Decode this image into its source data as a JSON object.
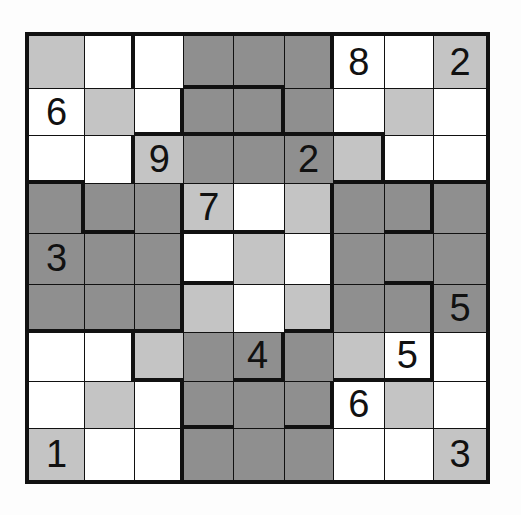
{
  "puzzle": {
    "type": "jigsaw-sudoku",
    "size": 9,
    "colors": {
      "W": "#ffffff",
      "L": "#c4c4c4",
      "D": "#8f8f8f",
      "line": "#111111"
    },
    "shading": [
      [
        "L",
        "W",
        "W",
        "D",
        "D",
        "D",
        "W",
        "W",
        "L"
      ],
      [
        "W",
        "L",
        "W",
        "D",
        "D",
        "D",
        "W",
        "L",
        "W"
      ],
      [
        "W",
        "W",
        "L",
        "D",
        "D",
        "D",
        "L",
        "W",
        "W"
      ],
      [
        "D",
        "D",
        "D",
        "L",
        "W",
        "L",
        "D",
        "D",
        "D"
      ],
      [
        "D",
        "D",
        "D",
        "W",
        "L",
        "W",
        "D",
        "D",
        "D"
      ],
      [
        "D",
        "D",
        "D",
        "L",
        "W",
        "L",
        "D",
        "D",
        "D"
      ],
      [
        "W",
        "W",
        "L",
        "D",
        "D",
        "D",
        "L",
        "W",
        "W"
      ],
      [
        "W",
        "L",
        "W",
        "D",
        "D",
        "D",
        "W",
        "L",
        "W"
      ],
      [
        "L",
        "W",
        "W",
        "D",
        "D",
        "D",
        "W",
        "W",
        "L"
      ]
    ],
    "givens": [
      [
        "",
        "",
        "",
        "",
        "",
        "",
        "8",
        "",
        "2"
      ],
      [
        "6",
        "",
        "",
        "",
        "",
        "",
        "",
        "",
        ""
      ],
      [
        "",
        "",
        "9",
        "",
        "",
        "2",
        "",
        "",
        ""
      ],
      [
        "",
        "",
        "",
        "7",
        "",
        "",
        "",
        "",
        ""
      ],
      [
        "3",
        "",
        "",
        "",
        "",
        "",
        "",
        "",
        ""
      ],
      [
        "",
        "",
        "",
        "",
        "",
        "",
        "",
        "",
        "5"
      ],
      [
        "",
        "",
        "",
        "",
        "4",
        "",
        "",
        "5",
        ""
      ],
      [
        "",
        "",
        "",
        "",
        "",
        "",
        "6",
        "",
        ""
      ],
      [
        "1",
        "",
        "",
        "",
        "",
        "",
        "",
        "",
        "3"
      ]
    ],
    "thick_right": [
      [
        0,
        1,
        0,
        0,
        0,
        1,
        0,
        0,
        0
      ],
      [
        0,
        0,
        1,
        0,
        1,
        0,
        0,
        0,
        0
      ],
      [
        0,
        1,
        0,
        0,
        0,
        0,
        1,
        0,
        0
      ],
      [
        1,
        0,
        1,
        0,
        0,
        1,
        0,
        1,
        0
      ],
      [
        0,
        0,
        1,
        0,
        0,
        1,
        0,
        0,
        0
      ],
      [
        0,
        0,
        1,
        0,
        0,
        1,
        0,
        1,
        0
      ],
      [
        0,
        1,
        0,
        0,
        1,
        0,
        0,
        1,
        0
      ],
      [
        0,
        0,
        1,
        0,
        0,
        1,
        0,
        0,
        0
      ],
      [
        0,
        0,
        1,
        0,
        0,
        0,
        0,
        0,
        0
      ]
    ],
    "thick_bottom": [
      [
        0,
        0,
        0,
        1,
        1,
        0,
        0,
        0,
        0
      ],
      [
        0,
        0,
        1,
        1,
        1,
        1,
        1,
        0,
        0
      ],
      [
        1,
        0,
        0,
        0,
        0,
        0,
        1,
        1,
        1
      ],
      [
        0,
        1,
        0,
        1,
        1,
        0,
        0,
        1,
        0
      ],
      [
        0,
        0,
        0,
        1,
        0,
        0,
        0,
        1,
        0
      ],
      [
        1,
        1,
        1,
        0,
        0,
        1,
        0,
        0,
        0
      ],
      [
        0,
        0,
        1,
        0,
        1,
        0,
        1,
        1,
        0
      ],
      [
        0,
        0,
        0,
        1,
        0,
        1,
        0,
        0,
        0
      ],
      [
        0,
        0,
        0,
        0,
        0,
        0,
        0,
        0,
        0
      ]
    ],
    "col_edges": [
      0,
      57,
      108,
      158,
      209,
      260,
      310,
      362,
      412,
      465
    ],
    "row_edges": [
      0,
      54,
      102,
      151,
      202,
      253,
      302,
      352,
      400,
      452
    ]
  }
}
